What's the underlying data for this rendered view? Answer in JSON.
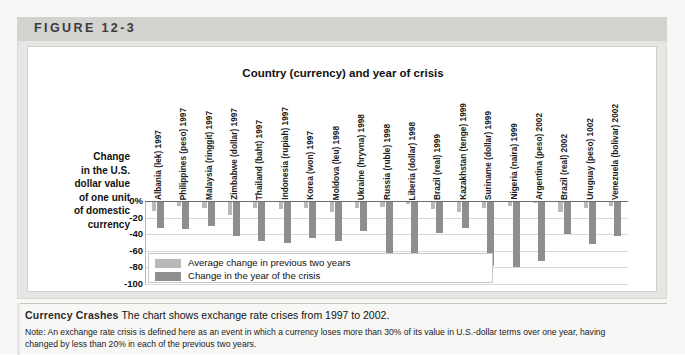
{
  "figure": {
    "label": "FIGURE 12-3"
  },
  "chart_data": {
    "type": "bar",
    "title": "Country (currency) and year of crisis",
    "xlabel": "Country (currency) and year of crisis",
    "ylabel": "Change in the U.S. dollar value of one unit of domestic currency",
    "ylim": [
      -100,
      0
    ],
    "yticks": [
      "0%",
      "-20",
      "-40",
      "-60",
      "-80",
      "-100"
    ],
    "grid": true,
    "legend_position": "inside-bottom-left",
    "categories": [
      "Albania (lek) 1997",
      "Philippines (peso) 1997",
      "Malaysia (ringgit) 1997",
      "Zimbabwe (dollar) 1997",
      "Thailand (baht) 1997",
      "Indonesia (rupiah) 1997",
      "Korea (won) 1997",
      "Moldova (leu) 1998",
      "Ukraine (hryvna) 1998",
      "Russia (ruble) 1998",
      "Liberia (dollar) 1998",
      "Brazil (real) 1999",
      "Kazakhstan (tenge) 1999",
      "Suriname (dollar) 1999",
      "Nigeria (naira) 1999",
      "Argentina (peso) 2002",
      "Brazil (real) 2002",
      "Uruguay (peso) 1002",
      "Venezuela (bolivar) 2002"
    ],
    "series": [
      {
        "name": "Average change in previous two years",
        "color": "#b9b9b7",
        "values": [
          -12,
          -6,
          -8,
          -17,
          -9,
          -10,
          -8,
          -13,
          -9,
          -7,
          -4,
          -10,
          -13,
          -9,
          -6,
          -3,
          -13,
          -9,
          -6
        ]
      },
      {
        "name": "Change in the year of the crisis",
        "color": "#8e8e8c",
        "values": [
          -33,
          -34,
          -30,
          -42,
          -48,
          -50,
          -44,
          -48,
          -36,
          -99,
          -99,
          -38,
          -33,
          -78,
          -80,
          -72,
          -40,
          -52,
          -42
        ]
      }
    ],
    "legend": [
      "Average change in previous two years",
      "Change in the year of the crisis"
    ]
  },
  "caption": {
    "strong": "Currency Crashes",
    "text": "The chart shows exchange rate crises from 1997 to 2002.",
    "note_line1": "Note: An exchange rate crisis is defined here as an event in which a currency loses more than 30% of its value in U.S.-dollar terms over one year, having",
    "note_line2": "changed by less than 20% in each of the previous two years."
  }
}
